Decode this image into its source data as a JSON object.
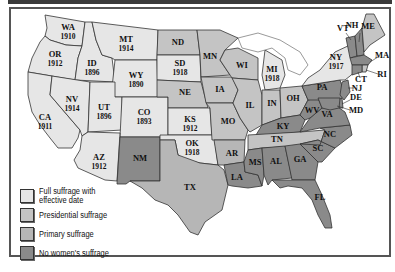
{
  "colors": {
    "full": "#e6e6e6",
    "presidential": "#c4c4c4",
    "primary": "#b6b6b6",
    "none": "#8a8a8a",
    "water": "#ffffff"
  },
  "legend": [
    {
      "key": "full",
      "label": "Full suffrage with effective date"
    },
    {
      "key": "presidential",
      "label": "Presidential suffrage"
    },
    {
      "key": "primary",
      "label": "Primary suffrage"
    },
    {
      "key": "none",
      "label": "No women's suffrage"
    }
  ],
  "states": [
    {
      "abbr": "WA",
      "year": "1910",
      "status": "full"
    },
    {
      "abbr": "OR",
      "year": "1912",
      "status": "full"
    },
    {
      "abbr": "CA",
      "year": "1911",
      "status": "full"
    },
    {
      "abbr": "ID",
      "year": "1896",
      "status": "full"
    },
    {
      "abbr": "NV",
      "year": "1914",
      "status": "full"
    },
    {
      "abbr": "MT",
      "year": "1914",
      "status": "full"
    },
    {
      "abbr": "WY",
      "year": "1890",
      "status": "full"
    },
    {
      "abbr": "UT",
      "year": "1896",
      "status": "full"
    },
    {
      "abbr": "CO",
      "year": "1893",
      "status": "full"
    },
    {
      "abbr": "AZ",
      "year": "1912",
      "status": "full"
    },
    {
      "abbr": "NM",
      "year": "",
      "status": "none"
    },
    {
      "abbr": "ND",
      "year": "",
      "status": "presidential"
    },
    {
      "abbr": "SD",
      "year": "1918",
      "status": "full"
    },
    {
      "abbr": "NE",
      "year": "",
      "status": "presidential"
    },
    {
      "abbr": "KS",
      "year": "1912",
      "status": "full"
    },
    {
      "abbr": "OK",
      "year": "1918",
      "status": "full"
    },
    {
      "abbr": "TX",
      "year": "",
      "status": "primary"
    },
    {
      "abbr": "MN",
      "year": "",
      "status": "presidential"
    },
    {
      "abbr": "IA",
      "year": "",
      "status": "presidential"
    },
    {
      "abbr": "MO",
      "year": "",
      "status": "presidential"
    },
    {
      "abbr": "AR",
      "year": "",
      "status": "primary"
    },
    {
      "abbr": "LA",
      "year": "",
      "status": "none"
    },
    {
      "abbr": "WI",
      "year": "",
      "status": "presidential"
    },
    {
      "abbr": "IL",
      "year": "",
      "status": "presidential"
    },
    {
      "abbr": "MI",
      "year": "1918",
      "status": "full"
    },
    {
      "abbr": "IN",
      "year": "",
      "status": "presidential"
    },
    {
      "abbr": "OH",
      "year": "",
      "status": "presidential"
    },
    {
      "abbr": "KY",
      "year": "",
      "status": "none"
    },
    {
      "abbr": "TN",
      "year": "",
      "status": "presidential"
    },
    {
      "abbr": "MS",
      "year": "",
      "status": "none"
    },
    {
      "abbr": "AL",
      "year": "",
      "status": "none"
    },
    {
      "abbr": "GA",
      "year": "",
      "status": "none"
    },
    {
      "abbr": "FL",
      "year": "",
      "status": "none"
    },
    {
      "abbr": "SC",
      "year": "",
      "status": "none"
    },
    {
      "abbr": "NC",
      "year": "",
      "status": "none"
    },
    {
      "abbr": "VA",
      "year": "",
      "status": "none"
    },
    {
      "abbr": "WV",
      "year": "",
      "status": "none"
    },
    {
      "abbr": "PA",
      "year": "",
      "status": "none"
    },
    {
      "abbr": "NY",
      "year": "1917",
      "status": "full"
    },
    {
      "abbr": "VT",
      "year": "",
      "status": "none"
    },
    {
      "abbr": "NH",
      "year": "",
      "status": "none"
    },
    {
      "abbr": "ME",
      "year": "",
      "status": "presidential"
    },
    {
      "abbr": "MA",
      "year": "",
      "status": "none"
    },
    {
      "abbr": "RI",
      "year": "",
      "status": "presidential"
    },
    {
      "abbr": "CT",
      "year": "",
      "status": "none"
    },
    {
      "abbr": "NJ",
      "year": "",
      "status": "none"
    },
    {
      "abbr": "DE",
      "year": "",
      "status": "none"
    },
    {
      "abbr": "MD",
      "year": "",
      "status": "none"
    }
  ]
}
